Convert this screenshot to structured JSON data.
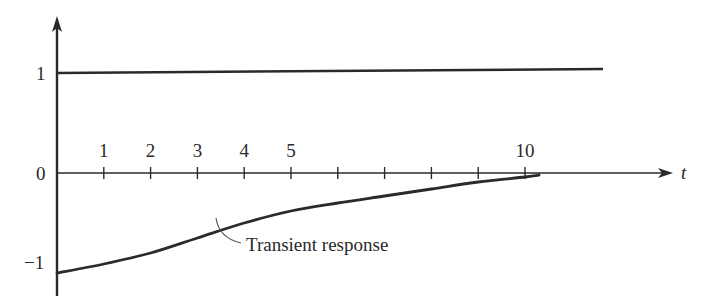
{
  "chart_data": {
    "type": "line",
    "title": "",
    "xlabel": "t",
    "ylabel": "",
    "xlim": [
      0,
      13.5
    ],
    "ylim": [
      -1.25,
      1.6
    ],
    "grid": false,
    "legend": "none",
    "x_ticks": [
      1,
      2,
      3,
      4,
      5,
      6,
      7,
      8,
      9,
      10
    ],
    "x_tick_labels": [
      "1",
      "2",
      "3",
      "4",
      "5",
      "",
      "",
      "",
      "",
      "10"
    ],
    "y_ticks": [
      1,
      0,
      -1
    ],
    "y_tick_labels": [
      "1",
      "0",
      "−1"
    ],
    "series": [
      {
        "name": "Steady-state (constant 1)",
        "x": [
          0,
          11.7
        ],
        "y": [
          1,
          1
        ]
      },
      {
        "name": "Transient response",
        "x": [
          0,
          1,
          2,
          3,
          4,
          5,
          6,
          7,
          8,
          9,
          10,
          10.3
        ],
        "y": [
          -1.0,
          -0.91,
          -0.8,
          -0.65,
          -0.5,
          -0.38,
          -0.3,
          -0.23,
          -0.16,
          -0.09,
          -0.04,
          -0.02
        ]
      }
    ],
    "annotations": [
      {
        "text": "Transient response",
        "points_to": {
          "x": 3.2,
          "y": -0.63
        }
      }
    ]
  },
  "labels": {
    "x_axis": "t",
    "y_1": "1",
    "y_0": "0",
    "y_neg1": "−1",
    "annotation": "Transient response",
    "ticks": [
      "1",
      "2",
      "3",
      "4",
      "5",
      "",
      "",
      "",
      "",
      "10"
    ]
  },
  "colors": {
    "ink": "#2a2a2a",
    "background": "#ffffff"
  }
}
